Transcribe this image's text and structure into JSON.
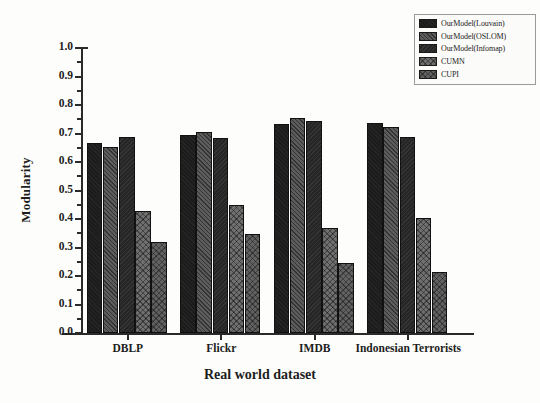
{
  "chart_data": {
    "type": "bar",
    "title": "",
    "xlabel": "Real world dataset",
    "ylabel": "Modularity",
    "categories": [
      "DBLP",
      "Flickr",
      "IMDB",
      "Indonesian Terrorists"
    ],
    "series": [
      {
        "name": "OurModel(Louvain)",
        "values": [
          0.665,
          0.694,
          0.735,
          0.737
        ],
        "color": "#1c1c1c"
      },
      {
        "name": "OurModel(OSLOM)",
        "values": [
          0.653,
          0.706,
          0.753,
          0.723
        ],
        "color": "#4a4a4a"
      },
      {
        "name": "OurModel(Infomap)",
        "values": [
          0.687,
          0.685,
          0.745,
          0.687
        ],
        "color": "#262626"
      },
      {
        "name": "CUMN",
        "values": [
          0.428,
          0.45,
          0.37,
          0.405
        ],
        "color": "#6f6f6f"
      },
      {
        "name": "CUPI",
        "values": [
          0.318,
          0.348,
          0.245,
          0.215
        ],
        "color": "#616161"
      }
    ],
    "ylim": [
      0.0,
      1.0
    ],
    "ytick_labels": [
      "0.0",
      "0.1",
      "0.2",
      "0.3",
      "0.4",
      "0.5",
      "0.6",
      "0.7",
      "0.8",
      "0.9",
      "1.0"
    ],
    "ytick_values": [
      0.0,
      0.1,
      0.2,
      0.3,
      0.4,
      0.5,
      0.6,
      0.7,
      0.8,
      0.9,
      1.0
    ],
    "grid": false,
    "legend_position": "top-right"
  },
  "legend": {
    "items": [
      {
        "label": "OurModel(Louvain)"
      },
      {
        "label": "OurModel(OSLOM)"
      },
      {
        "label": "OurModel(Infomap)"
      },
      {
        "label": "CUMN"
      },
      {
        "label": "CUPI"
      }
    ]
  }
}
